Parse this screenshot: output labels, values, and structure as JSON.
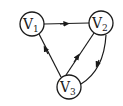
{
  "graph": {
    "type": "directed",
    "nodes": [
      {
        "id": "v1",
        "label": "V",
        "subscript": "1",
        "cx": 32,
        "cy": 24
      },
      {
        "id": "v2",
        "label": "V",
        "subscript": "2",
        "cx": 101,
        "cy": 23
      },
      {
        "id": "v3",
        "label": "V",
        "subscript": "3",
        "cx": 69,
        "cy": 87
      }
    ],
    "edges": [
      {
        "from": "v1",
        "to": "v2"
      },
      {
        "from": "v3",
        "to": "v1"
      },
      {
        "from": "v3",
        "to": "v2"
      },
      {
        "from": "v2",
        "to": "v3",
        "curved": true
      }
    ],
    "colors": {
      "stroke": "#1a1a1a",
      "fill": "#ffffff"
    }
  }
}
